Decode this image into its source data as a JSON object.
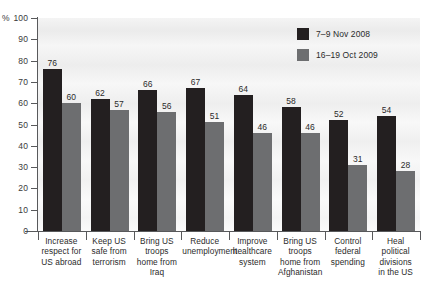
{
  "chart_data": {
    "type": "bar",
    "title": "",
    "subtitle": "",
    "xlabel": "",
    "ylabel": "%",
    "ylim": [
      0,
      100
    ],
    "ytick_step": 10,
    "yticks": [
      0,
      10,
      20,
      30,
      40,
      50,
      60,
      70,
      80,
      90,
      100
    ],
    "ytick_labels": [
      "0",
      "10",
      "20",
      "30",
      "40",
      "50",
      "60",
      "70",
      "80",
      "90",
      "100"
    ],
    "grid": false,
    "legend_position": "top-right",
    "categories": [
      "Increase respect for US abroad",
      "Keep US safe from terrorism",
      "Bring US troops home from Iraq",
      "Reduce unemployment",
      "Improve healthcare system",
      "Bring US troops home from Afghanistan",
      "Control federal spending",
      "Heal political divisions in the US"
    ],
    "category_label_lines": [
      [
        "Increase",
        "respect for",
        "US abroad"
      ],
      [
        "Keep US",
        "safe from",
        "terrorism"
      ],
      [
        "Bring US",
        "troops",
        "home from",
        "Iraq"
      ],
      [
        "Reduce",
        "unemployment"
      ],
      [
        "Improve",
        "healthcare",
        "system"
      ],
      [
        "Bring US",
        "troops",
        "home from",
        "Afghanistan"
      ],
      [
        "Control",
        "federal",
        "spending"
      ],
      [
        "Heal",
        "political",
        "divisions",
        "in the US"
      ]
    ],
    "series": [
      {
        "name": "7–9 Nov 2008",
        "color": "#231f20",
        "values": [
          76,
          62,
          66,
          67,
          64,
          58,
          52,
          54
        ]
      },
      {
        "name": "16–19 Oct 2009",
        "color": "#6d6e70",
        "values": [
          60,
          57,
          56,
          51,
          46,
          46,
          31,
          28
        ]
      }
    ]
  },
  "legend": {
    "items": [
      {
        "label": "7–9 Nov 2008",
        "color": "#231f20"
      },
      {
        "label": "16–19 Oct 2009",
        "color": "#6d6e70"
      }
    ]
  },
  "axis": {
    "y_unit": "%"
  },
  "colors": {
    "series_1": "#231f20",
    "series_2": "#6d6e70",
    "axis": "#58595b",
    "text": "#2b2b2b",
    "plot_background": "#f4f4f4"
  }
}
